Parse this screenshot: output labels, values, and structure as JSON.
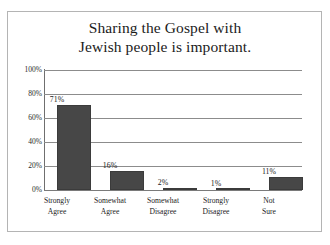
{
  "chart_data": {
    "type": "bar",
    "title": "Sharing the Gospel with Jewish people is important.",
    "title_lines": [
      "Sharing the Gospel with",
      "Jewish people is important."
    ],
    "categories": [
      "Strongly Agree",
      "Somewhat Agree",
      "Somewhat Disagree",
      "Strongly Disagree",
      "Not Sure"
    ],
    "category_lines": [
      [
        "Strongly",
        "Agree"
      ],
      [
        "Somewhat",
        "Agree"
      ],
      [
        "Somewhat",
        "Disagree"
      ],
      [
        "Strongly",
        "Disagree"
      ],
      [
        "Not",
        "Sure"
      ]
    ],
    "values": [
      71,
      16,
      2,
      1,
      11
    ],
    "value_labels": [
      "71%",
      "16%",
      "2%",
      "1%",
      "11%"
    ],
    "xlabel": "",
    "ylabel": "",
    "ylim": [
      0,
      100
    ],
    "yticks": [
      0,
      20,
      40,
      60,
      80,
      100
    ],
    "ytick_labels": [
      "0%",
      "20%",
      "40%",
      "60%",
      "80%",
      "100%"
    ],
    "grid": true,
    "legend": false,
    "bar_color": "#474747",
    "gridline_color": "#8c8c8c",
    "frame_color": "#b4b4b4",
    "background_color": "#ffffff"
  }
}
